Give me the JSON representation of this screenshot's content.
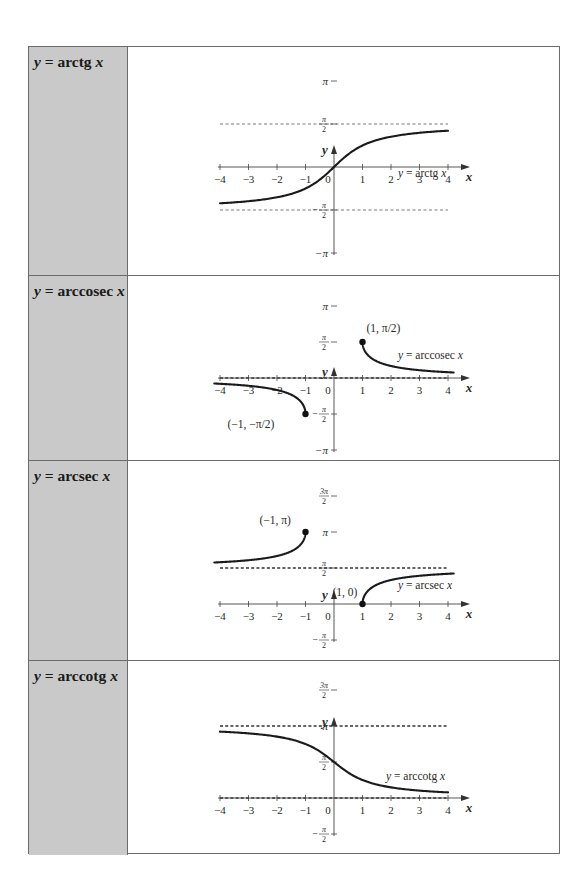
{
  "table": {
    "rows": [
      {
        "id": "arctg",
        "label_prefix": "y",
        "label_eq": " = arctg",
        "label_var": "x",
        "top": 0,
        "height": 229
      },
      {
        "id": "arccosec",
        "label_prefix": "y",
        "label_eq": " = arccosec",
        "label_var": "x",
        "top": 229,
        "height": 185
      },
      {
        "id": "arcsec",
        "label_prefix": "y",
        "label_eq": " = arcsec",
        "label_var": "x",
        "top": 414,
        "height": 200
      },
      {
        "id": "arccotg",
        "label_prefix": "y",
        "label_eq": " = arccotg",
        "label_var": "x",
        "top": 614,
        "height": 194
      }
    ]
  },
  "chart_data": [
    {
      "type": "line",
      "title": "y = arctg x",
      "xlabel": "x",
      "ylabel": "y",
      "xlim": [
        -4,
        4
      ],
      "xticks": [
        -4,
        -3,
        -2,
        -1,
        1,
        2,
        3,
        4
      ],
      "yticks": [
        "π",
        "π/2",
        "−π/2",
        "−π"
      ],
      "ylim": [
        -3.1416,
        3.1416
      ],
      "asymptotes": [
        "y = π/2",
        "y = −π/2"
      ],
      "series": [
        {
          "name": "y = arctg x",
          "x": [
            -4,
            -3,
            -2,
            -1,
            0,
            1,
            2,
            3,
            4
          ],
          "y": [
            -1.326,
            -1.249,
            -1.107,
            -0.785,
            0,
            0.785,
            1.107,
            1.249,
            1.326
          ]
        }
      ],
      "annotations": [
        "y = arctg x"
      ],
      "grid": false
    },
    {
      "type": "line",
      "title": "y = arccosec x",
      "xlabel": "x",
      "ylabel": "y",
      "xlim": [
        -4,
        4
      ],
      "xticks": [
        -4,
        -3,
        -2,
        -1,
        1,
        2,
        3,
        4
      ],
      "yticks": [
        "π",
        "π/2",
        "−π/2",
        "−π"
      ],
      "asymptotes": [
        "y = 0"
      ],
      "series": [
        {
          "name": "y = arccosec x (x ≥ 1)",
          "x": [
            1,
            1.5,
            2,
            3,
            4.2
          ],
          "y": [
            1.571,
            0.73,
            0.524,
            0.34,
            0.24
          ]
        },
        {
          "name": "y = arccosec x (x ≤ −1)",
          "x": [
            -4.2,
            -4,
            -3,
            -2,
            -1.5,
            -1
          ],
          "y": [
            -0.24,
            -0.253,
            -0.34,
            -0.524,
            -0.73,
            -1.571
          ]
        }
      ],
      "points": [
        {
          "x": 1,
          "y": 1.571,
          "label": "(1, π/2)"
        },
        {
          "x": -1,
          "y": -1.571,
          "label": "(−1, −π/2)"
        }
      ],
      "annotations": [
        "y = arccosec x"
      ],
      "grid": false
    },
    {
      "type": "line",
      "title": "y = arcsec x",
      "xlabel": "x",
      "ylabel": "y",
      "xlim": [
        -4,
        4
      ],
      "xticks": [
        -4,
        -3,
        -2,
        -1,
        1,
        2,
        3,
        4
      ],
      "yticks": [
        "3π/2",
        "π",
        "π/2",
        "−π/2"
      ],
      "asymptotes": [
        "y = π/2"
      ],
      "series": [
        {
          "name": "y = arcsec x (x ≥ 1)",
          "x": [
            1,
            1.5,
            2,
            3,
            4.2
          ],
          "y": [
            0,
            0.841,
            1.047,
            1.231,
            1.331
          ]
        },
        {
          "name": "y = arcsec x (x ≤ −1)",
          "x": [
            -4.2,
            -4,
            -3,
            -2,
            -1.5,
            -1
          ],
          "y": [
            1.811,
            1.823,
            1.911,
            2.094,
            2.301,
            3.142
          ]
        }
      ],
      "points": [
        {
          "x": -1,
          "y": 3.142,
          "label": "(−1, π)"
        },
        {
          "x": 1,
          "y": 0,
          "label": "(1, 0)"
        }
      ],
      "annotations": [
        "y = arcsec x"
      ],
      "grid": false
    },
    {
      "type": "line",
      "title": "y = arccotg x",
      "xlabel": "x",
      "ylabel": "y",
      "xlim": [
        -4,
        4
      ],
      "xticks": [
        -4,
        -3,
        -2,
        -1,
        1,
        2,
        3,
        4
      ],
      "yticks": [
        "3π/2",
        "π",
        "π/2",
        "−π/2"
      ],
      "asymptotes": [
        "y = π",
        "y = 0"
      ],
      "series": [
        {
          "name": "y = arccotg x",
          "x": [
            -4,
            -3,
            -2,
            -1,
            0,
            1,
            2,
            3,
            4
          ],
          "y": [
            2.897,
            2.82,
            2.678,
            2.356,
            1.571,
            0.785,
            0.464,
            0.322,
            0.245
          ]
        }
      ],
      "annotations": [
        "y = arccotg x"
      ],
      "grid": false
    }
  ],
  "graphs": [
    {
      "fn": "arctg",
      "origin": [
        206,
        120
      ],
      "ux": 28.5,
      "uhalfpi": 43,
      "xmin": -4,
      "xmax": 4,
      "dashed": [
        1,
        -1
      ],
      "dash_style": "thin",
      "yticks": [
        {
          "v": 2,
          "label": "π"
        },
        {
          "v": 1,
          "label": "π/2"
        },
        {
          "v": -1,
          "label": "−π/2"
        },
        {
          "v": -2,
          "label": "−π"
        }
      ],
      "axis_top": -2.35,
      "axis_bottom": -2.0,
      "axis_top_tip": 98,
      "curve_label": "y = arctg x",
      "curve_label_pos": [
        270,
        130
      ],
      "points": []
    },
    {
      "fn": "arccosec",
      "origin": [
        206,
        102
      ],
      "ux": 28.5,
      "uhalfpi": 36,
      "xmin": -4.2,
      "xmax": 4.2,
      "dashed": [
        0
      ],
      "dash_style": "thick",
      "yticks": [
        {
          "v": 2,
          "label": "π"
        },
        {
          "v": 1,
          "label": "π/2"
        },
        {
          "v": -1,
          "label": "−π/2"
        },
        {
          "v": -2,
          "label": "−π"
        }
      ],
      "axis_top_tip": 91,
      "axis_bottom": -2.0,
      "curve_label": "y = arccosec x",
      "curve_label_pos": [
        270,
        83
      ],
      "points": [
        {
          "x": 1,
          "v": 1,
          "label": "(1, π/2)",
          "dx": 4,
          "dy": -10
        },
        {
          "x": -1,
          "v": -1,
          "label": "(−1, −π/2)",
          "dx": -78,
          "dy": 14
        }
      ]
    },
    {
      "fn": "arcsec",
      "origin": [
        206,
        143
      ],
      "ux": 28.5,
      "uhalfpi": 36,
      "xmin": -4.2,
      "xmax": 4.2,
      "dashed": [
        1
      ],
      "dash_style": "thick",
      "yticks": [
        {
          "v": 3,
          "label": "3π/2"
        },
        {
          "v": 2,
          "label": "π"
        },
        {
          "v": 1,
          "label": "π/2"
        },
        {
          "v": -1,
          "label": "−π/2"
        }
      ],
      "axis_top_tip": 129,
      "axis_bottom": -1.0,
      "curve_label": "y = arcsec x",
      "curve_label_pos": [
        270,
        128
      ],
      "points": [
        {
          "x": -1,
          "v": 2,
          "label": "(−1, π)",
          "dx": -46,
          "dy": -8
        },
        {
          "x": 1,
          "v": 0,
          "label": "(1, 0)",
          "dx": -30,
          "dy": -8
        }
      ]
    },
    {
      "fn": "arccotg",
      "origin": [
        206,
        137
      ],
      "ux": 28.5,
      "uhalfpi": 36,
      "xmin": -4,
      "xmax": 4,
      "dashed": [
        2,
        0
      ],
      "dash_style": "thick",
      "yticks": [
        {
          "v": 3,
          "label": "3π/2"
        },
        {
          "v": 2,
          "label": "π"
        },
        {
          "v": 1,
          "label": "π/2"
        },
        {
          "v": -1,
          "label": "−π/2"
        }
      ],
      "axis_top_tip": 56,
      "axis_bottom": -1.0,
      "curve_label": "y = arccotg x",
      "curve_label_pos": [
        258,
        119
      ],
      "points": []
    }
  ]
}
